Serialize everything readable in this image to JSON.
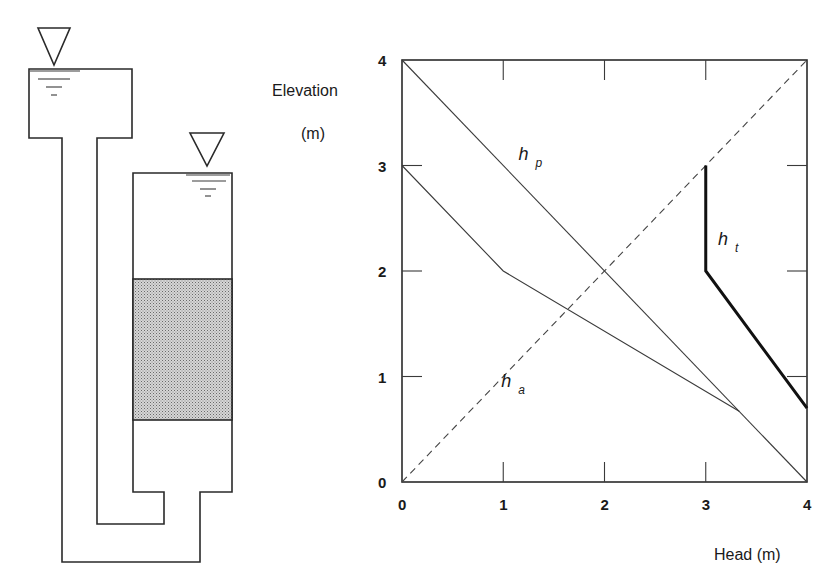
{
  "apparatus": {
    "upper_tank": {
      "x": 29,
      "y": 69,
      "w": 103,
      "h": 69,
      "water_symbol": "inverted-triangle"
    },
    "lower_tank": {
      "x": 133,
      "y": 173,
      "w": 99,
      "h": 319,
      "water_symbol": "inverted-triangle"
    },
    "soil_sample": {
      "y_top": 279,
      "y_bottom": 420,
      "fill": "#c8c8c8"
    },
    "pipe": {
      "inner_x": 97,
      "outer_x": 62,
      "inner_bottom_y": 524,
      "outer_bottom_y": 562,
      "inner_step_x": 164,
      "outer_step_x": 200
    }
  },
  "chart_data": {
    "type": "line",
    "title": "",
    "xlabel": "Head (m)",
    "ylabel": "Elevation",
    "ylabel_unit": "(m)",
    "xlim": [
      0,
      4
    ],
    "ylim": [
      0,
      4
    ],
    "x_ticks": [
      "0",
      "1",
      "2",
      "3",
      "4"
    ],
    "y_ticks": [
      "0",
      "1",
      "2",
      "3",
      "4"
    ],
    "grid": false,
    "series": [
      {
        "name": "h_p",
        "label_main": "h",
        "label_sub": "p",
        "style": "thin",
        "points": [
          [
            0,
            4
          ],
          [
            4,
            0
          ]
        ],
        "label_at": [
          1.15,
          3.05
        ]
      },
      {
        "name": "h_a",
        "label_main": "h",
        "label_sub": "a",
        "style": "dashed",
        "points": [
          [
            0,
            0
          ],
          [
            4,
            4
          ]
        ],
        "label_at": [
          0.98,
          0.9
        ]
      },
      {
        "name": "h_t",
        "label_main": "h",
        "label_sub": "t",
        "style": "thick",
        "points": [
          [
            3,
            3
          ],
          [
            3,
            2
          ],
          [
            4,
            0.7
          ]
        ],
        "label_at": [
          3.12,
          2.25
        ]
      },
      {
        "name": "unlabeled",
        "label_main": "",
        "label_sub": "",
        "style": "thin",
        "points": [
          [
            0,
            3
          ],
          [
            1,
            2
          ],
          [
            3.33,
            0.67
          ]
        ],
        "label_at": null
      }
    ]
  }
}
